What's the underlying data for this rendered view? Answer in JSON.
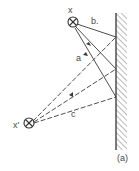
{
  "diagram": {
    "type": "mirror-reflection",
    "caption": "(a)",
    "source": {
      "label": "x",
      "symbol": "circled-cross"
    },
    "image": {
      "label": "x'",
      "symbol": "circled-cross"
    },
    "rays": [
      {
        "label": "a",
        "style": "solid-with-arrows"
      },
      {
        "label": "b.",
        "style": "solid"
      },
      {
        "label": "c",
        "style": "dashed"
      }
    ],
    "mirror": {
      "style": "hatched-wall"
    },
    "colors": {
      "line": "#3a3a3a",
      "text": "#4a4a4a",
      "background": "#ffffff"
    }
  }
}
